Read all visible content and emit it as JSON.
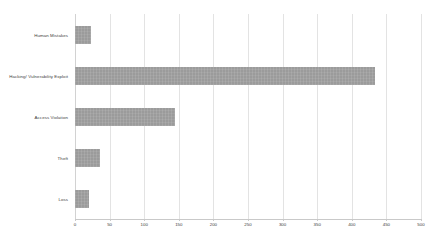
{
  "chart_data": {
    "type": "bar",
    "orientation": "horizontal",
    "title": "",
    "subtitle": "",
    "xlabel": "",
    "ylabel": "",
    "categories": [
      "Human Mistakes",
      "Hacking/ Vulnerability Exploit",
      "Access Violation",
      "Theft",
      "Loss"
    ],
    "values": [
      23,
      433,
      145,
      36,
      20
    ],
    "xlim": [
      0,
      500
    ],
    "xticks": [
      0,
      50,
      100,
      150,
      200,
      250,
      300,
      350,
      400,
      450,
      500
    ],
    "xtick_labels": [
      "0",
      "50",
      "100",
      "150",
      "200",
      "250",
      "300",
      "350",
      "400",
      "450",
      "500"
    ],
    "grid": true,
    "grid_axis": "x",
    "legend": false,
    "legend_position": "none",
    "bar_color": "#a3a3a3",
    "gridline_color": "#e3e3e3",
    "axis_color": "#c9c9c9",
    "text_color": "#3d3d3d",
    "background_color": "#ffffff"
  }
}
